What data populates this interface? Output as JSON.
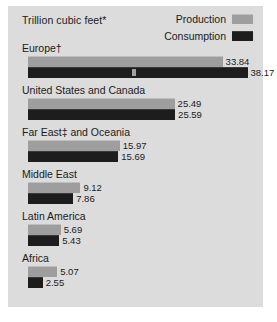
{
  "panel": {
    "background_color": "#dcdcdc"
  },
  "header": {
    "units_title": "Trillion cubic feet*"
  },
  "legend": {
    "position": "top-right",
    "entries": [
      {
        "label": "Production",
        "color": "#9e9e9e",
        "icon": "legend-swatch-icon"
      },
      {
        "label": "Consumption",
        "color": "#1d1d1d",
        "icon": "legend-swatch-icon"
      }
    ]
  },
  "chart_data": {
    "type": "bar",
    "title": "Trillion cubic feet*",
    "subtitle": "",
    "xlabel": "",
    "ylabel": "",
    "orientation": "horizontal",
    "grid": false,
    "legend_position": "top-right",
    "xlim": [
      0,
      38.17
    ],
    "categories": [
      "Europe†",
      "United States and Canada",
      "Far East‡ and Oceania",
      "Middle East",
      "Latin America",
      "Africa"
    ],
    "series": [
      {
        "name": "Production",
        "color": "#9e9e9e",
        "values": [
          33.84,
          25.49,
          15.97,
          9.12,
          5.69,
          5.07
        ]
      },
      {
        "name": "Consumption",
        "color": "#1d1d1d",
        "values": [
          38.17,
          25.59,
          15.69,
          7.86,
          5.43,
          2.55
        ]
      }
    ],
    "value_labels": [
      [
        "33.84",
        "38.17"
      ],
      [
        "25.49",
        "25.59"
      ],
      [
        "15.97",
        "15.69"
      ],
      [
        "9.12",
        "7.86"
      ],
      [
        "5.69",
        "5.43"
      ],
      [
        "5.07",
        "2.55"
      ]
    ],
    "annotations": [
      "* units are trillion cubic feet",
      "† Europe footnote marker",
      "‡ Far East footnote marker"
    ]
  },
  "scale": {
    "pixels_per_unit": 5.75,
    "bar_origin_x": 20
  }
}
